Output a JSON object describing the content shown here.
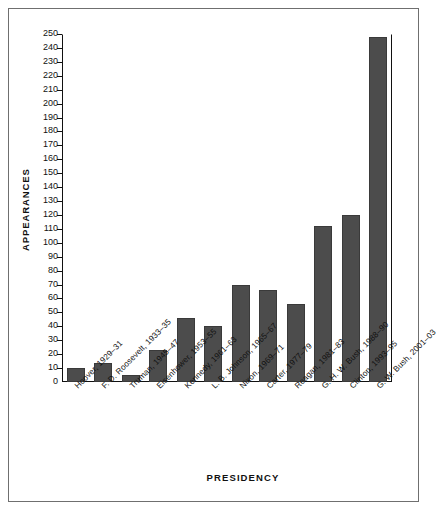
{
  "chart_data": {
    "type": "bar",
    "title": "",
    "xlabel": "PRESIDENCY",
    "ylabel": "APPEARANCES",
    "ylim": [
      0,
      250
    ],
    "ytick_step": 10,
    "yticks": [
      0,
      10,
      20,
      30,
      40,
      50,
      60,
      70,
      80,
      90,
      100,
      110,
      120,
      130,
      140,
      150,
      160,
      170,
      180,
      190,
      200,
      210,
      220,
      230,
      240,
      250
    ],
    "grid": false,
    "legend": null,
    "bar_color": "#4c4c4c",
    "bar_edge_color": "#3a3a3a",
    "axis_color": "#111111",
    "categories": [
      "Hoover, 1929–31",
      "F. D. Roosevelt, 1933–35",
      "Truman, 1945–47",
      "Eisenhower, 1953–55",
      "Kennedy, 1961–63",
      "L. B. Johnson, 1965–67",
      "Nixon, 1969–71",
      "Carter, 1977–79",
      "Reagan, 1981–83",
      "G. H. W. Bush, 1988–90",
      "Clinton, 1993–95",
      "G. W. Bush, 2001–03"
    ],
    "values": [
      10,
      14,
      5,
      23,
      46,
      40,
      70,
      66,
      56,
      112,
      120,
      248
    ]
  }
}
